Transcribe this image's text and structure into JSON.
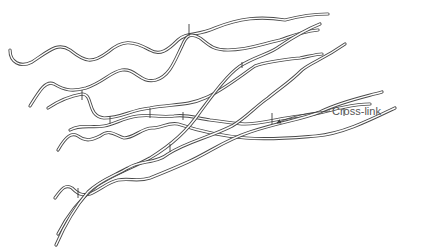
{
  "diagram": {
    "colors": {
      "strand": "#4a4a4a",
      "background": "#ffffff",
      "label": "#555555"
    },
    "chains": [
      {
        "id": "chain-1",
        "description": "top wavy chain"
      },
      {
        "id": "chain-2",
        "description": "second wavy chain"
      },
      {
        "id": "chain-3",
        "description": "third chain"
      },
      {
        "id": "chain-4",
        "description": "fourth chain"
      },
      {
        "id": "chain-5",
        "description": "fifth chain"
      },
      {
        "id": "chain-6",
        "description": "sixth chain"
      },
      {
        "id": "chain-7",
        "description": "long diagonal chain"
      },
      {
        "id": "chain-8",
        "description": "bottom long diagonal chain"
      }
    ],
    "cross_links": 10,
    "annotation": {
      "label": "Cross-link",
      "icon": "arrow-icon"
    }
  }
}
